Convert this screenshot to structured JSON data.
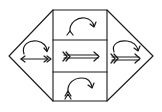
{
  "diagram": {
    "colors": {
      "background": "#ffffff",
      "stroke": "#1a1a1a"
    },
    "outline": {
      "left_apex": [
        9,
        56
      ],
      "right_apex": [
        153,
        56
      ],
      "box": {
        "left": 53,
        "right": 107,
        "top": 10,
        "bottom": 101
      },
      "dividers_y": [
        40,
        72
      ]
    },
    "regions": [
      {
        "id": "left-triangle",
        "content": [
          "curved-arrow-clockwise",
          "left-arrow-with-feathered-tail"
        ]
      },
      {
        "id": "top-cell",
        "content": [
          "curved-arrow-clockwise-from-fork"
        ]
      },
      {
        "id": "middle-cell",
        "content": [
          "double-right-arrow-with-feathered-tail"
        ]
      },
      {
        "id": "bottom-cell",
        "content": [
          "curved-arrow-clockwise-from-double-fork"
        ]
      },
      {
        "id": "right-triangle",
        "content": [
          "curved-arrow-clockwise",
          "double-right-arrow-with-feathered-tail"
        ]
      }
    ]
  }
}
